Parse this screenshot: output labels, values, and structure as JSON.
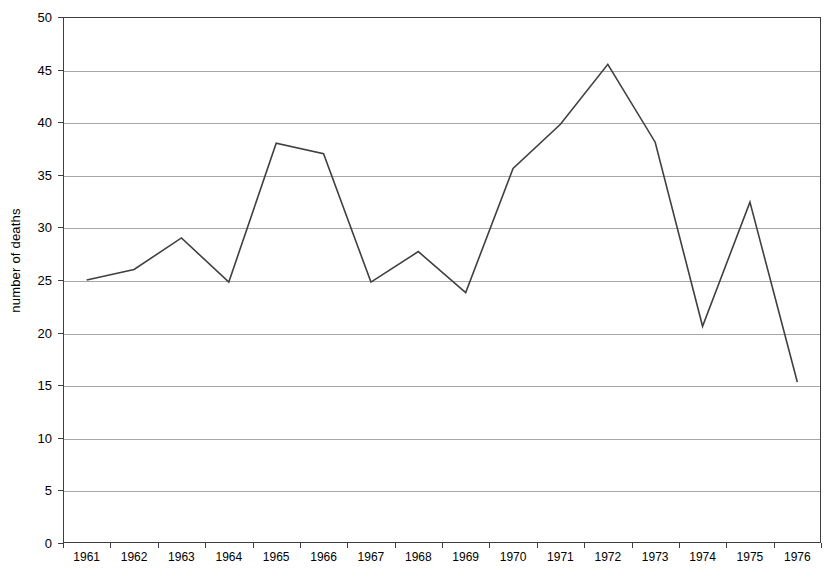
{
  "chart_data": {
    "type": "line",
    "title": "",
    "xlabel": "",
    "ylabel": "number of deaths",
    "categories": [
      "1961",
      "1962",
      "1963",
      "1964",
      "1965",
      "1966",
      "1967",
      "1968",
      "1969",
      "1970",
      "1971",
      "1972",
      "1973",
      "1974",
      "1975",
      "1976"
    ],
    "values": [
      25.0,
      26.0,
      29.0,
      24.8,
      38.0,
      37.0,
      24.8,
      27.7,
      23.8,
      35.6,
      39.8,
      45.5,
      38.1,
      20.6,
      32.4,
      15.3
    ],
    "series": [
      {
        "name": "number of deaths",
        "values": [
          25.0,
          26.0,
          29.0,
          24.8,
          38.0,
          37.0,
          24.8,
          27.7,
          23.8,
          35.6,
          39.8,
          45.5,
          38.1,
          20.6,
          32.4,
          15.3
        ]
      }
    ],
    "ylim": [
      0,
      50
    ],
    "ytick_interval": 5,
    "yticks": [
      "0",
      "5",
      "10",
      "15",
      "20",
      "25",
      "30",
      "35",
      "40",
      "45",
      "50"
    ],
    "grid": "horizontal",
    "legend": "none",
    "line_color": "#404040",
    "gridline_color": "#a6a6a6",
    "axis_color": "#3f3f3f",
    "background_color": "#ffffff"
  }
}
